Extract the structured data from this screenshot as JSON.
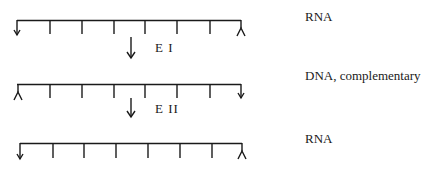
{
  "diagram": {
    "strands": [
      {
        "id": "strand-1",
        "label": "RNA",
        "left_end": "arrow-down",
        "right_end": "fork",
        "y": 20,
        "ticks": 6
      },
      {
        "id": "strand-2",
        "label": "DNA, complementary",
        "left_end": "fork",
        "right_end": "arrow-down",
        "y": 84,
        "ticks": 6
      },
      {
        "id": "strand-3",
        "label": "RNA",
        "left_end": "arrow-down",
        "right_end": "fork",
        "y": 143,
        "ticks": 6
      }
    ],
    "steps": [
      {
        "id": "step-1",
        "enzyme": "E I"
      },
      {
        "id": "step-2",
        "enzyme": "E II"
      }
    ],
    "colors": {
      "line": "#1a1a1a",
      "background": "#ffffff"
    }
  }
}
